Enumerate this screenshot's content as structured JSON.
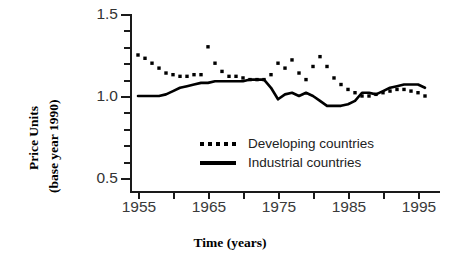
{
  "chart_data": {
    "type": "line",
    "title": "",
    "xlabel": "Time (years)",
    "ylabel_line1": "Price Units",
    "ylabel_line2": "(base year 1990)",
    "xlim": [
      1955,
      1996
    ],
    "ylim": [
      0.5,
      1.5
    ],
    "grid": false,
    "legend_position": "inside-center",
    "x_ticks": [
      "1955",
      "1965",
      "1975",
      "1985",
      "1995"
    ],
    "x_tick_values": [
      1955,
      1965,
      1975,
      1985,
      1995
    ],
    "x_minor_tick_values": [
      1960,
      1970,
      1980,
      1990,
      2000
    ],
    "y_ticks": [
      "1.5",
      "1.0",
      "0.5"
    ],
    "y_tick_values": [
      1.5,
      1.0,
      0.5
    ],
    "y_minor_tick_values": [
      1.4,
      1.3,
      1.2,
      1.1,
      0.9,
      0.8,
      0.7,
      0.6
    ],
    "x": [
      1955,
      1956,
      1957,
      1958,
      1959,
      1960,
      1961,
      1962,
      1963,
      1964,
      1965,
      1966,
      1967,
      1968,
      1969,
      1970,
      1971,
      1972,
      1973,
      1974,
      1975,
      1976,
      1977,
      1978,
      1979,
      1980,
      1981,
      1982,
      1983,
      1984,
      1985,
      1986,
      1987,
      1988,
      1989,
      1990,
      1991,
      1992,
      1993,
      1994,
      1995,
      1996
    ],
    "series": [
      {
        "name": "Developing countries",
        "style": "dotted",
        "color": "#000000",
        "values": [
          1.25,
          1.23,
          1.2,
          1.17,
          1.14,
          1.13,
          1.12,
          1.12,
          1.13,
          1.13,
          1.3,
          1.2,
          1.15,
          1.12,
          1.12,
          1.11,
          1.1,
          1.1,
          1.1,
          1.13,
          1.2,
          1.17,
          1.22,
          1.14,
          1.1,
          1.18,
          1.24,
          1.18,
          1.11,
          1.07,
          1.04,
          1.02,
          1.0,
          1.0,
          1.01,
          1.02,
          1.03,
          1.04,
          1.04,
          1.03,
          1.02,
          1.0
        ]
      },
      {
        "name": "Industrial countries",
        "style": "solid",
        "color": "#000000",
        "values": [
          1.0,
          1.0,
          1.0,
          1.0,
          1.01,
          1.03,
          1.05,
          1.06,
          1.07,
          1.08,
          1.08,
          1.09,
          1.09,
          1.09,
          1.09,
          1.09,
          1.1,
          1.1,
          1.1,
          1.05,
          0.98,
          1.01,
          1.02,
          1.0,
          1.02,
          1.0,
          0.97,
          0.94,
          0.94,
          0.94,
          0.95,
          0.97,
          1.02,
          1.02,
          1.01,
          1.03,
          1.05,
          1.06,
          1.07,
          1.07,
          1.07,
          1.05
        ]
      }
    ]
  },
  "legend": {
    "items": [
      {
        "label": "Developing countries",
        "style": "dotted"
      },
      {
        "label": "Industrial countries",
        "style": "solid"
      }
    ]
  }
}
